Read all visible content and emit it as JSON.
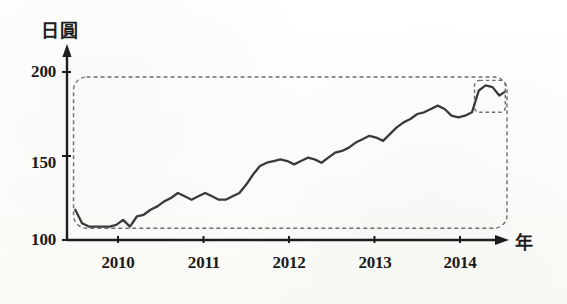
{
  "figure": {
    "y_axis_title": "日圓",
    "x_axis_title": "年",
    "y_tick_labels": [
      "200",
      "150",
      "100"
    ],
    "x_tick_labels": [
      "2010",
      "2011",
      "2012",
      "2013",
      "2014"
    ],
    "line_color": "#3a3a3a",
    "axis_color": "#1d1d1d",
    "annotation_color": "#6e6e6e",
    "background_color": "#fdfdfb"
  },
  "chart_data": {
    "type": "line",
    "title": "",
    "subtitle": "",
    "xlabel": "年",
    "ylabel": "日圓",
    "xlim": [
      2009.45,
      2014.55
    ],
    "ylim": [
      100,
      205
    ],
    "yticks": [
      100,
      150,
      200
    ],
    "ytick_labels": [
      "100",
      "150",
      "200"
    ],
    "xticks": [
      2010,
      2011,
      2012,
      2013,
      2014
    ],
    "xtick_labels": [
      "2010",
      "2011",
      "2012",
      "2013",
      "2014"
    ],
    "grid": false,
    "legend": "none",
    "series": [
      {
        "name": "日圓",
        "x": [
          2009.5,
          2009.58,
          2009.66,
          2009.74,
          2009.82,
          2009.9,
          2009.98,
          2010.06,
          2010.14,
          2010.22,
          2010.3,
          2010.38,
          2010.46,
          2010.54,
          2010.62,
          2010.7,
          2010.78,
          2010.86,
          2010.94,
          2011.02,
          2011.1,
          2011.18,
          2011.26,
          2011.34,
          2011.42,
          2011.5,
          2011.58,
          2011.66,
          2011.74,
          2011.82,
          2011.9,
          2011.98,
          2012.06,
          2012.14,
          2012.22,
          2012.3,
          2012.38,
          2012.46,
          2012.54,
          2012.62,
          2012.7,
          2012.78,
          2012.86,
          2012.94,
          2013.02,
          2013.1,
          2013.18,
          2013.26,
          2013.34,
          2013.42,
          2013.5,
          2013.58,
          2013.66,
          2013.74,
          2013.82,
          2013.9,
          2013.98,
          2014.06,
          2014.14,
          2014.22,
          2014.3,
          2014.38,
          2014.46,
          2014.52
        ],
        "y": [
          118,
          110,
          108,
          108,
          108,
          108,
          109,
          112,
          108,
          114,
          115,
          118,
          120,
          123,
          125,
          128,
          126,
          124,
          126,
          128,
          126,
          124,
          124,
          126,
          128,
          133,
          139,
          144,
          146,
          147,
          148,
          147,
          145,
          147,
          149,
          148,
          146,
          149,
          152,
          153,
          155,
          158,
          160,
          162,
          161,
          159,
          163,
          167,
          170,
          172,
          175,
          176,
          178,
          180,
          178,
          174,
          173,
          174,
          176,
          189,
          192,
          191,
          186,
          188
        ]
      }
    ],
    "annotations": [
      {
        "name": "full-range-highlight",
        "type": "dashed-rounded-rect",
        "x_range": [
          2009.48,
          2014.55
        ],
        "y_range": [
          107,
          197
        ]
      },
      {
        "name": "recent-peak-highlight",
        "type": "dashed-rounded-rect",
        "x_range": [
          2014.17,
          2014.53
        ],
        "y_range": [
          176,
          195
        ]
      }
    ]
  }
}
